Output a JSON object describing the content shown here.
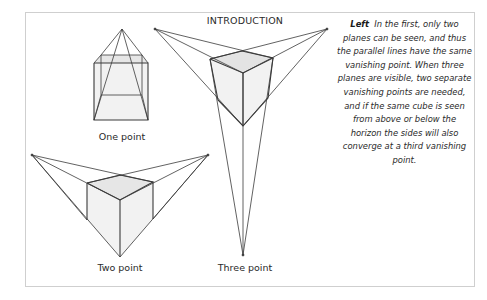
{
  "heading": "INTRODUCTION",
  "sidebar": {
    "lead": "Left",
    "text": "In the first, only two planes can be seen, and thus the parallel lines have the same vanishing point. When three planes are visible, two separate vanishing points are needed, and if the same cube is seen from above or below the horizon the sides will also converge at a third vanishing point."
  },
  "figures": [
    {
      "id": "one-point",
      "caption": "One point"
    },
    {
      "id": "two-point",
      "caption": "Two point"
    },
    {
      "id": "three-point",
      "caption": "Three point"
    }
  ],
  "colors": {
    "line": "#3a3a3a",
    "face_light": "#efefef",
    "face_top": "#e3e3e3",
    "border": "#cfcfcf"
  }
}
